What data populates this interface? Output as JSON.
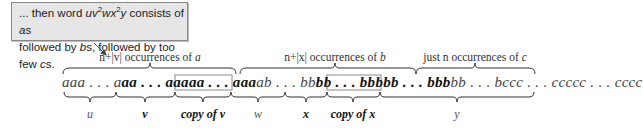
{
  "callout": {
    "line1_prefix": "... then word ",
    "word": "uv",
    "sup1": "2",
    "word2": "wx",
    "sup2": "2",
    "word3": "y",
    "line1_suffix": " consists of ",
    "a_s": "a",
    "s1": "s",
    "line2_prefix": "followed by ",
    "b_s": "b",
    "s2": "s",
    "line2_mid": ", followed by too few ",
    "c_s": "c",
    "s3": "s."
  },
  "top_labels": [
    {
      "prefix": "n+|v| occurrences of ",
      "var": "a"
    },
    {
      "prefix": "n+|x| occurrences of ",
      "var": "b"
    },
    {
      "prefix": "just n occurrences of ",
      "var": "c"
    }
  ],
  "string": {
    "seg_u": "aaa . . . a",
    "seg_v": "aa . . . aaa",
    "seg_copy_v": "aa . . . aaa",
    "seg_w": "ab . . . bb",
    "seg_x": "bb . . . bbb",
    "seg_copy_x": "bb . . . bbb",
    "seg_y": "bb . . . bccc . . . ccccc . . . cccc"
  },
  "bottom_labels": {
    "u": "u",
    "v": "v",
    "copy_v": "copy  of v",
    "w": "w",
    "x": "x",
    "copy_x": "copy of x",
    "y": "y"
  }
}
